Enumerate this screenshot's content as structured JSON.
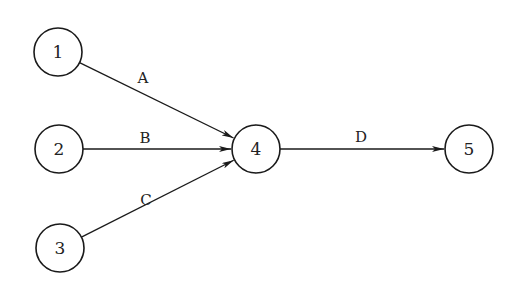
{
  "diagram": {
    "type": "activity-on-arrow network",
    "nodes": [
      {
        "id": "1",
        "label": "1",
        "x": 58,
        "y": 52
      },
      {
        "id": "2",
        "label": "2",
        "x": 59,
        "y": 149
      },
      {
        "id": "3",
        "label": "3",
        "x": 60,
        "y": 248
      },
      {
        "id": "4",
        "label": "4",
        "x": 256,
        "y": 149
      },
      {
        "id": "5",
        "label": "5",
        "x": 469,
        "y": 149
      }
    ],
    "edges": [
      {
        "from": "1",
        "to": "4",
        "label": "A",
        "lx": 143,
        "ly": 83
      },
      {
        "from": "2",
        "to": "4",
        "label": "B",
        "lx": 145,
        "ly": 143
      },
      {
        "from": "3",
        "to": "4",
        "label": "C",
        "lx": 146,
        "ly": 205
      },
      {
        "from": "4",
        "to": "5",
        "label": "D",
        "lx": 361,
        "ly": 142
      }
    ],
    "node_radius": 24,
    "stroke_color": "#1a1a1a"
  }
}
